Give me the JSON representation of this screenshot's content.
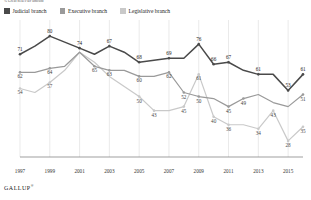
{
  "subtitle": "% Great deal/Fair amount",
  "legend": {
    "items": [
      {
        "label": "Judicial branch",
        "color": "#4a4a4a",
        "key": "judicial"
      },
      {
        "label": "Executive branch",
        "color": "#9a9a9a",
        "key": "executive"
      },
      {
        "label": "Legislative branch",
        "color": "#c9c9c9",
        "key": "legislative"
      }
    ]
  },
  "brand": {
    "name": "GALLUP",
    "mark": "®"
  },
  "chart_data": {
    "type": "line",
    "title": "",
    "subtitle": "% Great deal/Fair amount",
    "xlabel": "",
    "ylabel": "",
    "ylim": [
      20,
      85
    ],
    "grid": "vertical-only",
    "legend_position": "top-left",
    "x": [
      1997,
      1998,
      1999,
      2000,
      2001,
      2002,
      2003,
      2004,
      2005,
      2006,
      2007,
      2008,
      2009,
      2010,
      2011,
      2012,
      2013,
      2014,
      2015,
      2016
    ],
    "tick_labels": [
      "1997",
      "1999",
      "2001",
      "2003",
      "2005",
      "2007",
      "2009",
      "2011",
      "2013",
      "2015"
    ],
    "tick_x": [
      1997,
      1999,
      2001,
      2003,
      2005,
      2007,
      2009,
      2011,
      2013,
      2015
    ],
    "series": [
      {
        "name": "Judicial branch",
        "color": "#4a4a4a",
        "values": [
          71,
          75,
          80,
          77,
          74,
          71,
          75,
          72,
          67,
          68,
          69,
          69,
          76,
          66,
          67,
          63,
          61,
          61,
          53,
          61
        ],
        "labels": {
          "1997": "71",
          "1999": "80",
          "2001": "74",
          "2003": "67",
          "2005": "68",
          "2007": "69",
          "2009": "76",
          "2010": "66",
          "2011": "67",
          "2013": "61",
          "2015": "53",
          "2016": "61"
        }
      },
      {
        "name": "Executive branch",
        "color": "#9a9a9a",
        "values": [
          62,
          62,
          64,
          65,
          72,
          65,
          63,
          63,
          60,
          60,
          62,
          52,
          50,
          49,
          45,
          49,
          51,
          47,
          45,
          51
        ],
        "labels": {
          "1997": "62",
          "1999": "64",
          "2002": "65",
          "2003": "63",
          "2005": "60",
          "2007": "62",
          "2008": "52",
          "2009": "50",
          "2011": "45",
          "2012": "49",
          "2016": "51"
        }
      },
      {
        "name": "Legislative branch",
        "color": "#c9c9c9",
        "values": [
          54,
          52,
          57,
          63,
          72,
          67,
          60,
          55,
          50,
          43,
          43,
          45,
          61,
          40,
          36,
          36,
          34,
          43,
          28,
          35
        ],
        "labels": {
          "1997": "54",
          "1999": "57",
          "2005": "50",
          "2006": "43",
          "2008": "45",
          "2009": "61",
          "2010": "40",
          "2011": "36",
          "2013": "34",
          "2014": "43",
          "2015": "28",
          "2016": "35"
        }
      }
    ]
  }
}
